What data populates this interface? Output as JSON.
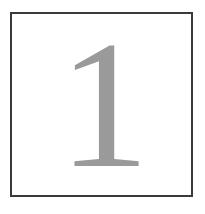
{
  "page": {
    "name": "page-number-plate",
    "background_color": "#ffffff",
    "width": 205,
    "height": 214
  },
  "frame": {
    "name": "border-frame",
    "border_color": "#3a3a3a",
    "border_width_px": 2,
    "fill_color": "#ffffff",
    "left": 10,
    "top": 12,
    "width": 183,
    "height": 185
  },
  "numeral": {
    "name": "page-number",
    "value": "1",
    "color": "#9a9a9a",
    "style": "serif",
    "font_size_px": 182,
    "alignment": "center"
  }
}
